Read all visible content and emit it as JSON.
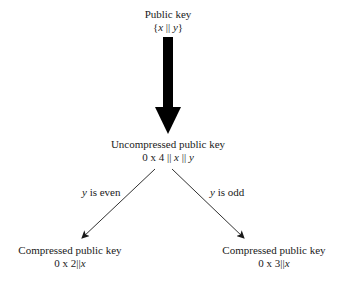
{
  "nodes": {
    "public_key": {
      "title": "Public key",
      "formula_open": "{",
      "formula_x": "x",
      "formula_sep": " || ",
      "formula_y": "y",
      "formula_close": "}"
    },
    "uncompressed": {
      "title": "Uncompressed public key",
      "formula_prefix": "0 x 4 || ",
      "formula_x": "x",
      "formula_sep": " || ",
      "formula_y": "y"
    },
    "compressed_even": {
      "title": "Compressed public key",
      "formula_prefix": "0 x 2||",
      "formula_x": "x"
    },
    "compressed_odd": {
      "title": "Compressed public key",
      "formula_prefix": "0 x 3||",
      "formula_x": "x"
    }
  },
  "edges": {
    "even": {
      "var": "y",
      "text": " is even"
    },
    "odd": {
      "var": "y",
      "text": " is odd"
    }
  },
  "colors": {
    "ink": "#1a1a1a",
    "arrow": "#000000",
    "background": "#ffffff"
  }
}
